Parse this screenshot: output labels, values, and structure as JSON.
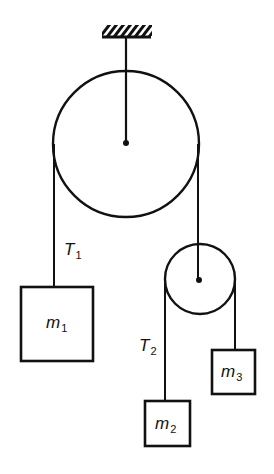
{
  "diagram": {
    "title": "",
    "type": "pulley-system",
    "nodes": [
      {
        "id": "ceiling",
        "label": "",
        "kind": "fixed-support"
      },
      {
        "id": "pulley_large",
        "label": "",
        "kind": "pulley"
      },
      {
        "id": "pulley_small",
        "label": "",
        "kind": "pulley"
      },
      {
        "id": "m1",
        "label": "m",
        "sub": "1",
        "kind": "mass"
      },
      {
        "id": "m2",
        "label": "m",
        "sub": "2",
        "kind": "mass"
      },
      {
        "id": "m3",
        "label": "m",
        "sub": "3",
        "kind": "mass"
      }
    ],
    "edges": [
      {
        "from": "ceiling",
        "to": "pulley_large",
        "kind": "rod"
      },
      {
        "from": "pulley_large",
        "to": "m1",
        "kind": "string",
        "label": "T",
        "sub": "1"
      },
      {
        "from": "pulley_large",
        "to": "pulley_small",
        "kind": "string"
      },
      {
        "from": "pulley_small",
        "to": "m2",
        "kind": "string",
        "label": "T",
        "sub": "2"
      },
      {
        "from": "pulley_small",
        "to": "m3",
        "kind": "string"
      }
    ]
  },
  "labels": {
    "t1": {
      "main": "T",
      "sub": "1"
    },
    "t2": {
      "main": "T",
      "sub": "2"
    },
    "m1": {
      "main": "m",
      "sub": "1"
    },
    "m2": {
      "main": "m",
      "sub": "2"
    },
    "m3": {
      "main": "m",
      "sub": "3"
    }
  },
  "colors": {
    "ink": "#111111",
    "background": "#ffffff"
  }
}
